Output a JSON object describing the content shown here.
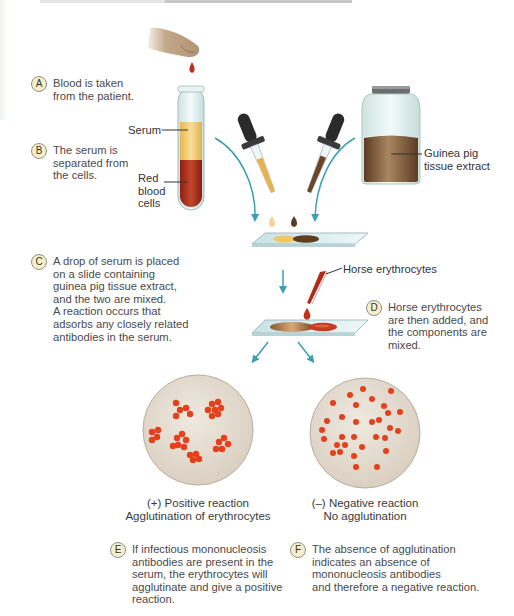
{
  "figure": {
    "colors": {
      "arrow": "#3aa0b4",
      "serum": "#f0c766",
      "red_cells": "#a8281a",
      "extract": "#6d4a2c",
      "cells_dot": "#e5401c",
      "circle_bg": "#e5ddd2",
      "badge_bg": "#f7efc6",
      "slide": "#d9ecef"
    },
    "labels": {
      "serum": "Serum",
      "red_blood_cells": "Red\nblood\ncells",
      "guinea_pig_extract": "Guinea pig\ntissue extract",
      "horse_erythrocytes": "Horse erythrocytes"
    },
    "steps": [
      {
        "letter": "A",
        "text": "Blood is taken\nfrom the patient."
      },
      {
        "letter": "B",
        "text": "The serum is\nseparated from\nthe cells."
      },
      {
        "letter": "C",
        "text": "A drop of serum is placed\non a slide containing\nguinea pig tissue extract,\nand the two are mixed.\nA reaction occurs that\nadsorbs any closely related\nantibodies in the serum."
      },
      {
        "letter": "D",
        "text": "Horse erythrocytes\nare then added, and\nthe components are\nmixed."
      },
      {
        "letter": "E",
        "text": "If infectious mononucleosis\nantibodies are present in the\nserum, the erythrocytes will\nagglutinate and give a positive\nreaction."
      },
      {
        "letter": "F",
        "text": "The absence of agglutination\nindicates an absence of\nmononucleosis antibodies\nand therefore a negative reaction."
      }
    ],
    "results": {
      "positive": "(+) Positive reaction\nAgglutination of erythrocytes",
      "negative": "(–) Negative reaction\nNo agglutination"
    }
  }
}
